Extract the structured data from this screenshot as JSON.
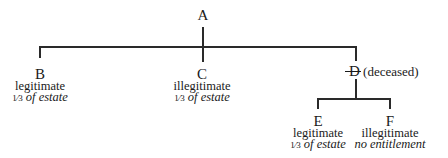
{
  "diagram": {
    "type": "family-tree",
    "root": {
      "label": "A"
    },
    "children": [
      {
        "label": "B",
        "status": "legitimate",
        "fraction": "1⁄3",
        "share_text": "of estate"
      },
      {
        "label": "C",
        "status": "illegitimate",
        "fraction": "1⁄3",
        "share_text": "of estate"
      },
      {
        "label": "D",
        "annotation": "(deceased)",
        "struck": true,
        "children": [
          {
            "label": "E",
            "status": "legitimate",
            "fraction": "1⁄3",
            "share_text": "of estate"
          },
          {
            "label": "F",
            "status": "illegitimate",
            "share_text": "no entitlement"
          }
        ]
      }
    ],
    "line_color": "#2a2a2a"
  }
}
